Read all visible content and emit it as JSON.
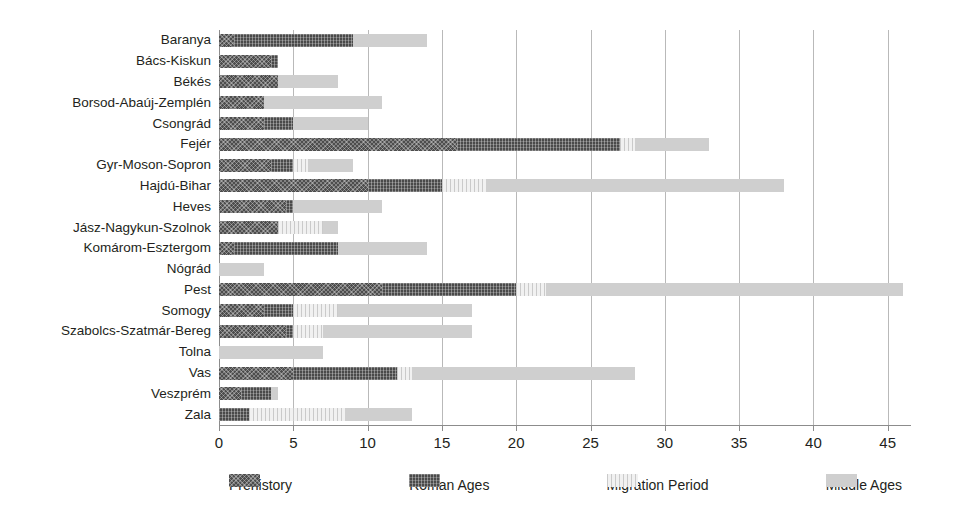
{
  "chart_data": {
    "type": "bar",
    "orientation": "horizontal",
    "stacked": true,
    "title": "",
    "xlabel": "",
    "ylabel": "",
    "xlim": [
      0,
      46.5
    ],
    "xticks": [
      0,
      5,
      10,
      15,
      20,
      25,
      30,
      35,
      40,
      45
    ],
    "grid": "vertical",
    "legend_position": "bottom",
    "categories": [
      "Baranya",
      "Bács-Kiskun",
      "Békés",
      "Borsod-Abaúj-Zemplén",
      "Csongrád",
      "Fejér",
      "Gyr-Moson-Sopron",
      "Hajdú-Bihar",
      "Heves",
      "Jász-Nagykun-Szolnok",
      "Komárom-Esztergom",
      "Nógrád",
      "Pest",
      "Somogy",
      "Szabolcs-Szatmár-Bereg",
      "Tolna",
      "Vas",
      "Veszprém",
      "Zala"
    ],
    "series": [
      {
        "name": "Prehistory",
        "key": "prehistory",
        "color": "#4d4d4d",
        "values": [
          1,
          3.5,
          4,
          3,
          3,
          16,
          3.5,
          10,
          4.5,
          4,
          1,
          0,
          11,
          3,
          4.5,
          0,
          5,
          1.5,
          0
        ]
      },
      {
        "name": "Roman Ages",
        "key": "roman",
        "color": "#4a4a4a",
        "values": [
          8,
          0.5,
          0,
          0,
          2,
          11,
          1.5,
          5,
          0.5,
          0,
          7,
          0,
          9,
          2,
          0.5,
          0,
          7,
          2,
          2
        ]
      },
      {
        "name": "Migration Period",
        "key": "migration",
        "color": "#f1f1f1",
        "values": [
          0,
          0,
          0,
          0,
          0,
          1,
          1,
          3,
          0,
          3,
          0,
          0,
          2,
          3,
          2,
          0,
          1,
          0,
          6.5
        ]
      },
      {
        "name": "Middle Ages",
        "key": "middle",
        "color": "#cfcfcf",
        "values": [
          5,
          0,
          4,
          8,
          5,
          5,
          3,
          20,
          6,
          1,
          6,
          3,
          24,
          9,
          10,
          7,
          15,
          0.5,
          4.5
        ]
      }
    ],
    "totals": [
      14,
      4,
      8,
      11,
      10,
      33,
      9,
      38,
      11,
      8,
      14,
      3,
      46,
      17,
      17,
      7,
      28,
      4,
      13
    ]
  },
  "legend": {
    "items": [
      {
        "label": "Prehistory",
        "key": "prehistory"
      },
      {
        "label": "Roman Ages",
        "key": "roman"
      },
      {
        "label": "Migration Period",
        "key": "migration"
      },
      {
        "label": "Middle Ages",
        "key": "middle"
      }
    ]
  }
}
